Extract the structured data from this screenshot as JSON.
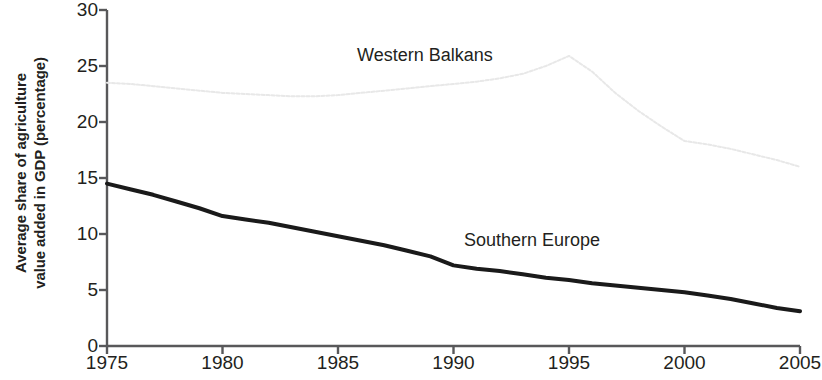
{
  "chart_data": {
    "type": "line",
    "title": "",
    "xlabel": "",
    "ylabel": "Average share of agriculture value added in GDP (percentage)",
    "ylabel_line1": "Average share of agriculture",
    "ylabel_line2": "value added in GDP (percentage)",
    "xlim": [
      1975,
      2005
    ],
    "ylim": [
      0,
      30
    ],
    "grid": false,
    "legend_position": "inline-annotations",
    "x_ticks": [
      "1975",
      "1980",
      "1985",
      "1990",
      "1995",
      "2000",
      "2005"
    ],
    "y_ticks": [
      "0",
      "5",
      "10",
      "15",
      "20",
      "25",
      "30"
    ],
    "x": [
      1975,
      1976,
      1977,
      1978,
      1979,
      1980,
      1981,
      1982,
      1983,
      1984,
      1985,
      1986,
      1987,
      1988,
      1989,
      1990,
      1991,
      1992,
      1993,
      1994,
      1995,
      1996,
      1997,
      1998,
      1999,
      2000,
      2001,
      2002,
      2003,
      2004,
      2005
    ],
    "series": [
      {
        "name": "Western Balkans",
        "color": "#e8e8e8",
        "style": "dotted",
        "width": 2,
        "values": [
          23.5,
          23.4,
          23.2,
          23.0,
          22.8,
          22.6,
          22.5,
          22.4,
          22.3,
          22.3,
          22.4,
          22.6,
          22.8,
          23.0,
          23.2,
          23.4,
          23.6,
          23.9,
          24.3,
          25.0,
          25.9,
          24.5,
          22.6,
          21.0,
          19.6,
          18.3,
          18.0,
          17.6,
          17.1,
          16.6,
          16.0
        ]
      },
      {
        "name": "Southern Europe",
        "color": "#1a1a1a",
        "style": "solid",
        "width": 4,
        "values": [
          14.5,
          14.0,
          13.5,
          12.9,
          12.3,
          11.6,
          11.3,
          11.0,
          10.6,
          10.2,
          9.8,
          9.4,
          9.0,
          8.5,
          8.0,
          7.2,
          6.9,
          6.7,
          6.4,
          6.1,
          5.9,
          5.6,
          5.4,
          5.2,
          5.0,
          4.8,
          4.5,
          4.2,
          3.8,
          3.4,
          3.1
        ]
      }
    ],
    "annotations": [
      {
        "text": "Western Balkans",
        "series": "Western Balkans"
      },
      {
        "text": "Southern Europe",
        "series": "Southern Europe"
      }
    ]
  },
  "axis": {
    "color": "#58585a"
  }
}
